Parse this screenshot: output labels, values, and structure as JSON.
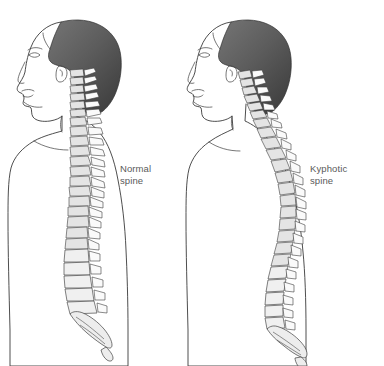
{
  "illustration": {
    "title": "Normal spine versus kyphotic spine comparison",
    "background_color": "#ffffff",
    "line_color": "#3a3a3a",
    "hair_color": "#585858",
    "label_color": "#5a5a5a",
    "vertebra_fill": "#ededed"
  },
  "figures": [
    {
      "id": "normal",
      "name": "Normal spine figure",
      "view": "left lateral profile",
      "spine_condition": "normal",
      "label": {
        "line1": "Normal",
        "line2": "spine",
        "x": 120,
        "y": 172
      },
      "anatomy": {
        "head": "shaded dark hair, visible facial profile with eye, nose, lips, chin, ear",
        "cervical_curve": "lordotic, gentle forward curve",
        "thoracic_curve": "mild kyphotic curve",
        "lumbar_curve": "lordotic",
        "sacrum": "posteriorly angled sacrum and coccyx"
      }
    },
    {
      "id": "kyphotic",
      "name": "Kyphotic spine figure",
      "view": "left lateral profile",
      "spine_condition": "kyphotic",
      "label": {
        "line1": "Kyphotic",
        "line2": "spine",
        "x": 310,
        "y": 172
      },
      "anatomy": {
        "head": "shaded dark hair, forward head posture, visible facial profile",
        "cervical_curve": "forward-angled, head thrust anteriorly",
        "thoracic_curve": "exaggerated convex hump",
        "lumbar_curve": "reduced lordosis",
        "sacrum": "posteriorly angled sacrum and coccyx"
      }
    }
  ],
  "canvas": {
    "width": 384,
    "height": 366
  }
}
